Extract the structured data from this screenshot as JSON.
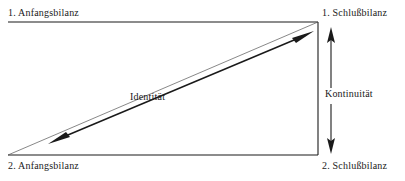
{
  "diagram": {
    "type": "schematic-arrow-diagram",
    "background_color": "#ffffff",
    "line_color": "#1a1a1a",
    "labels": {
      "top_left": "1. Anfangsbilanz",
      "top_right": "1. Schlußbilanz",
      "bottom_left": "2. Anfangsbilanz",
      "bottom_right": "2. Schlußbilanz",
      "diagonal": "Identität",
      "vertical": "Kontinuität"
    },
    "edges": [
      {
        "name": "top-horizontal-line",
        "from": [
          8,
          22
        ],
        "to": [
          318,
          22
        ],
        "arrow": "none",
        "weight": "thin"
      },
      {
        "name": "bottom-horizontal-line",
        "from": [
          8,
          155
        ],
        "to": [
          318,
          155
        ],
        "arrow": "none",
        "weight": "thin"
      },
      {
        "name": "right-vertical-line",
        "from": [
          318,
          22
        ],
        "to": [
          318,
          155
        ],
        "arrow": "none",
        "weight": "thin"
      },
      {
        "name": "diagonal-thin-line",
        "from": [
          8,
          155
        ],
        "to": [
          318,
          22
        ],
        "arrow": "none",
        "weight": "hairline"
      },
      {
        "name": "identity-double-arrow",
        "from": [
          50,
          143
        ],
        "to": [
          312,
          33
        ],
        "arrow": "both",
        "weight": "thick"
      },
      {
        "name": "continuity-arrow-up",
        "from": [
          331,
          88
        ],
        "to": [
          331,
          30
        ],
        "arrow": "start-to-end",
        "weight": "thin"
      },
      {
        "name": "continuity-arrow-down",
        "from": [
          331,
          105
        ],
        "to": [
          331,
          152
        ],
        "arrow": "start-to-end",
        "weight": "thin"
      }
    ]
  }
}
